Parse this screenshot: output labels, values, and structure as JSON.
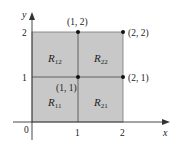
{
  "diagram": {
    "type": "partitioned-rectangle",
    "axes": {
      "x_label": "x",
      "y_label": "y",
      "origin_label": "0",
      "x_ticks": [
        "1",
        "2"
      ],
      "y_ticks": [
        "1",
        "2"
      ]
    },
    "regions": [
      {
        "name": "R",
        "sub": "11"
      },
      {
        "name": "R",
        "sub": "21"
      },
      {
        "name": "R",
        "sub": "12"
      },
      {
        "name": "R",
        "sub": "22"
      }
    ],
    "points": [
      {
        "label": "(1, 2)"
      },
      {
        "label": "(2, 2)"
      },
      {
        "label": "(1, 1)"
      },
      {
        "label": "(2, 1)"
      }
    ],
    "colors": {
      "fill": "#c8c8c8",
      "line": "#555555",
      "axis": "#333333",
      "point": "#111111"
    }
  }
}
